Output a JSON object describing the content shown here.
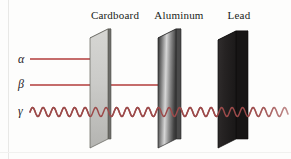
{
  "figure": {
    "width": 291,
    "height": 159,
    "background": "#fdfdfc"
  },
  "barriers": [
    {
      "id": "cardboard",
      "label": "Cardboard",
      "label_x": 115,
      "label_y": 16,
      "face_fill_top": "#d2d2cf",
      "face_fill_bottom": "#b9b9b6",
      "edge_fill": "#6d6d6a",
      "outline": "#55554f",
      "front_top_x": 90,
      "front_top_y": 38,
      "front_bottom_x": 90,
      "front_bottom_y": 148,
      "back_top_x": 108,
      "back_top_y": 29,
      "back_bottom_x": 108,
      "back_bottom_y": 139,
      "thickness": 3
    },
    {
      "id": "aluminum",
      "label": "Aluminum",
      "label_x": 179,
      "label_y": 16,
      "face_fill_top": "#3a3a3a",
      "face_fill_bottom": "#c9c9c9",
      "edge_fill": "#4a4a4a",
      "outline": "#2b2b2b",
      "front_top_x": 158,
      "front_top_y": 38,
      "front_bottom_x": 158,
      "front_bottom_y": 148,
      "back_top_x": 176,
      "back_top_y": 29,
      "back_bottom_x": 176,
      "back_bottom_y": 139,
      "thickness": 5
    },
    {
      "id": "lead",
      "label": "Lead",
      "label_x": 239,
      "label_y": 16,
      "face_fill_top": "#2e2b2b",
      "face_fill_bottom": "#211f1f",
      "edge_fill": "#151314",
      "outline": "#0d0c0c",
      "front_top_x": 218,
      "front_top_y": 40,
      "front_bottom_x": 218,
      "front_bottom_y": 148,
      "back_top_x": 236,
      "back_top_y": 31,
      "back_bottom_x": 236,
      "back_bottom_y": 139,
      "thickness": 12
    }
  ],
  "rays": [
    {
      "id": "alpha",
      "label": "α",
      "label_x": 18,
      "label_y": 53,
      "type": "straight",
      "color": "#b23b3b",
      "stroke_width": 1.4,
      "y": 59,
      "x_start": 30,
      "x_end": 93,
      "stopped_by": "cardboard"
    },
    {
      "id": "beta",
      "label": "β",
      "label_x": 18,
      "label_y": 78,
      "type": "straight",
      "color": "#b23b3b",
      "stroke_width": 1.4,
      "y": 85,
      "x_start": 30,
      "x_end": 161,
      "stopped_by": "aluminum"
    },
    {
      "id": "gamma",
      "label": "γ",
      "label_x": 18,
      "label_y": 105,
      "type": "wave",
      "color": "#9c4a4a",
      "stroke_width": 1.5,
      "y": 112,
      "x_start": 30,
      "x_end": 288,
      "wavelength": 10.5,
      "amplitude": 4.5,
      "stopped_by": "none",
      "fade_from_x": 255
    }
  ]
}
